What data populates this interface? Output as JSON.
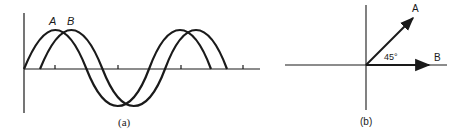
{
  "panel_a": {
    "caption": "(a)",
    "curve_labels": {
      "a": "A",
      "b": "B"
    },
    "description": "Two sine waves, B lagging A by 45 degrees"
  },
  "panel_b": {
    "caption": "(b)",
    "phasor_labels": {
      "a": "A",
      "b": "B"
    },
    "angle_label": "45°"
  },
  "colors": {
    "ink": "#1a1a1a",
    "background": "#ffffff"
  }
}
